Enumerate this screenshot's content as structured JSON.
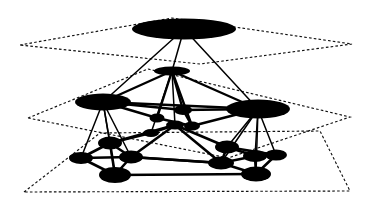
{
  "figure": {
    "background_color": "#ffffff",
    "ink_color": "#000000",
    "width": 374,
    "height": 205
  },
  "chart_data": {
    "type": "diagram",
    "subtype": "layered-node-link-graph",
    "grid": false,
    "legend": null,
    "xlabel": "",
    "ylabel": "",
    "levels": [
      {
        "id": "level-0",
        "name": "coarsest-level",
        "node_count": 1,
        "plane": "20,45 172,18 352,44 200,64"
      },
      {
        "id": "level-1",
        "name": "intermediate-level",
        "node_count": 7,
        "plane": "28,118 148,69 350,117 228,158"
      },
      {
        "id": "level-2",
        "name": "finest-level",
        "node_count": 11,
        "plane": "24,192 100,133 320,131 350,191"
      }
    ],
    "nodes": [
      {
        "id": "n0",
        "level": 0,
        "x": 184,
        "y": 29,
        "rx": 52,
        "ry": 10.5
      },
      {
        "id": "m0",
        "level": 1,
        "x": 172,
        "y": 71,
        "rx": 18,
        "ry": 4.5
      },
      {
        "id": "m1",
        "level": 1,
        "x": 103,
        "y": 102,
        "rx": 28,
        "ry": 8.5
      },
      {
        "id": "m2",
        "level": 1,
        "x": 258,
        "y": 109,
        "rx": 32,
        "ry": 9.5
      },
      {
        "id": "m3",
        "level": 1,
        "x": 183,
        "y": 110,
        "rx": 9,
        "ry": 5
      },
      {
        "id": "m4",
        "level": 1,
        "x": 157,
        "y": 118,
        "rx": 7.5,
        "ry": 4.5
      },
      {
        "id": "m5",
        "level": 1,
        "x": 192,
        "y": 126,
        "rx": 8,
        "ry": 4.5
      },
      {
        "id": "m6",
        "level": 1,
        "x": 172,
        "y": 71,
        "rx": 10,
        "ry": 3
      },
      {
        "id": "f0",
        "level": 2,
        "x": 110,
        "y": 143,
        "rx": 12,
        "ry": 6.5
      },
      {
        "id": "f1",
        "level": 2,
        "x": 81,
        "y": 158,
        "rx": 12,
        "ry": 6
      },
      {
        "id": "f2",
        "level": 2,
        "x": 131,
        "y": 157,
        "rx": 12,
        "ry": 6.5
      },
      {
        "id": "f3",
        "level": 2,
        "x": 115,
        "y": 175,
        "rx": 16,
        "ry": 8
      },
      {
        "id": "f4",
        "level": 2,
        "x": 227,
        "y": 147,
        "rx": 12,
        "ry": 6.5
      },
      {
        "id": "f5",
        "level": 2,
        "x": 255,
        "y": 156,
        "rx": 12,
        "ry": 6
      },
      {
        "id": "f6",
        "level": 2,
        "x": 276,
        "y": 155,
        "rx": 11,
        "ry": 5.5
      },
      {
        "id": "f7",
        "level": 2,
        "x": 221,
        "y": 163,
        "rx": 13,
        "ry": 6.5
      },
      {
        "id": "f8",
        "level": 2,
        "x": 256,
        "y": 174,
        "rx": 15,
        "ry": 7.5
      },
      {
        "id": "f9",
        "level": 2,
        "x": 175,
        "y": 125,
        "rx": 9,
        "ry": 4.5
      },
      {
        "id": "f10",
        "level": 2,
        "x": 151,
        "y": 133,
        "rx": 8,
        "ry": 4
      }
    ],
    "intra_level_edges": [
      [
        "m0",
        "m1"
      ],
      [
        "m0",
        "m2"
      ],
      [
        "m0",
        "m3"
      ],
      [
        "m0",
        "m4"
      ],
      [
        "m0",
        "m5"
      ],
      [
        "m1",
        "m3"
      ],
      [
        "m1",
        "m4"
      ],
      [
        "m1",
        "m2"
      ],
      [
        "m3",
        "m2"
      ],
      [
        "m4",
        "m5"
      ],
      [
        "m5",
        "m2"
      ],
      [
        "m3",
        "m5"
      ],
      [
        "f0",
        "f1"
      ],
      [
        "f0",
        "f2"
      ],
      [
        "f0",
        "f3"
      ],
      [
        "f1",
        "f3"
      ],
      [
        "f2",
        "f3"
      ],
      [
        "f1",
        "f2"
      ],
      [
        "f3",
        "f8"
      ],
      [
        "f2",
        "f7"
      ],
      [
        "f0",
        "f9"
      ],
      [
        "f2",
        "f9"
      ],
      [
        "f4",
        "f5"
      ],
      [
        "f4",
        "f7"
      ],
      [
        "f5",
        "f6"
      ],
      [
        "f5",
        "f7"
      ],
      [
        "f5",
        "f8"
      ],
      [
        "f6",
        "f8"
      ],
      [
        "f7",
        "f8"
      ],
      [
        "f4",
        "f6"
      ],
      [
        "f7",
        "f2"
      ],
      [
        "f4",
        "f9"
      ],
      [
        "f9",
        "f10"
      ],
      [
        "f10",
        "f0"
      ],
      [
        "f9",
        "f7"
      ]
    ],
    "inter_level_edges": [
      [
        "n0",
        "m0"
      ],
      [
        "n0",
        "m1"
      ],
      [
        "n0",
        "m2"
      ],
      [
        "m1",
        "f0"
      ],
      [
        "m1",
        "f1"
      ],
      [
        "m1",
        "f2"
      ],
      [
        "m1",
        "f3"
      ],
      [
        "m2",
        "f4"
      ],
      [
        "m2",
        "f5"
      ],
      [
        "m2",
        "f6"
      ],
      [
        "m2",
        "f7"
      ],
      [
        "m2",
        "f8"
      ],
      [
        "m0",
        "f9"
      ],
      [
        "m0",
        "f10"
      ]
    ]
  }
}
